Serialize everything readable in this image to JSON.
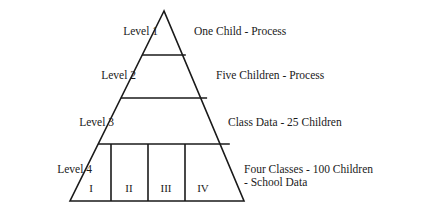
{
  "diagram": {
    "type": "pyramid",
    "stroke_color": "#1a1a1a",
    "background_color": "#ffffff",
    "apex": {
      "x": 164,
      "y": 11
    },
    "base": {
      "left_x": 70,
      "right_x": 244,
      "y": 201
    },
    "levels": [
      {
        "id": "level-1",
        "level_label": "Level 1",
        "description": "One Child - Process",
        "divider_y": 55
      },
      {
        "id": "level-2",
        "level_label": "Level 2",
        "description": "Five Children - Process",
        "divider_y": 98
      },
      {
        "id": "level-3",
        "level_label": "Level 3",
        "description": "Class Data - 25 Children",
        "divider_y": 144
      },
      {
        "id": "level-4",
        "level_label": "Level 4",
        "description_line1": "Four Classes - 100 Children",
        "description_line2": "- School Data",
        "divider_y": 201
      }
    ],
    "base_cells": [
      {
        "id": "cell-1",
        "label": "I"
      },
      {
        "id": "cell-2",
        "label": "II"
      },
      {
        "id": "cell-3",
        "label": "III"
      },
      {
        "id": "cell-4",
        "label": "IV"
      }
    ],
    "base_cell_dividers_x": [
      111,
      148,
      185
    ]
  }
}
